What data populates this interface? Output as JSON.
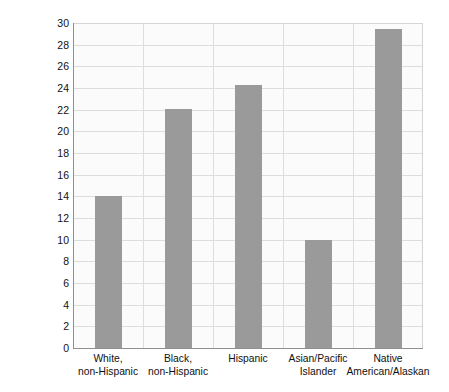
{
  "chart_data": {
    "type": "bar",
    "title": "",
    "xlabel": "",
    "ylabel": "PERCENTAGE REPORTING FAIR OR POOR HEALTH",
    "ylabel_lines": [
      "PERCENTAGE REPORTING FAIR OR",
      "POOR HEALTH"
    ],
    "categories": [
      "White, non-Hispanic",
      "Black, non-Hispanic",
      "Hispanic",
      "Asian/Pacific Islander",
      "Native American/Alaskan"
    ],
    "category_lines": [
      [
        "White,",
        "non-Hispanic"
      ],
      [
        "Black,",
        "non-Hispanic"
      ],
      [
        "Hispanic",
        ""
      ],
      [
        "Asian/Pacific",
        "Islander"
      ],
      [
        "Native",
        "American/Alaskan"
      ]
    ],
    "values": [
      14.0,
      22.1,
      24.3,
      10.0,
      29.4
    ],
    "ylim": [
      0,
      30
    ],
    "ytick_step": 2,
    "yticks": [
      0,
      2,
      4,
      6,
      8,
      10,
      12,
      14,
      16,
      18,
      20,
      22,
      24,
      26,
      28,
      30
    ],
    "grid": "both",
    "legend": "none",
    "bar_color": "#9a9a9a",
    "grid_color": "#dddddd",
    "axis_color": "#8f8f8f",
    "plot_background": "#fbfbfb",
    "text_color": "#111111"
  }
}
